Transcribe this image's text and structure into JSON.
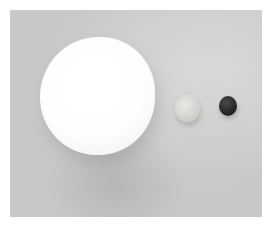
{
  "image": {
    "description": "Grayscale photograph of three spheres of decreasing size on a light gray surface",
    "objects": [
      {
        "name": "large-white-sphere",
        "color": "#fefefe"
      },
      {
        "name": "medium-light-sphere",
        "color": "#d6d6d1"
      },
      {
        "name": "small-dark-sphere",
        "color": "#222222"
      }
    ],
    "background_color": "#cfcfcf",
    "border_color": "#ffffff"
  }
}
